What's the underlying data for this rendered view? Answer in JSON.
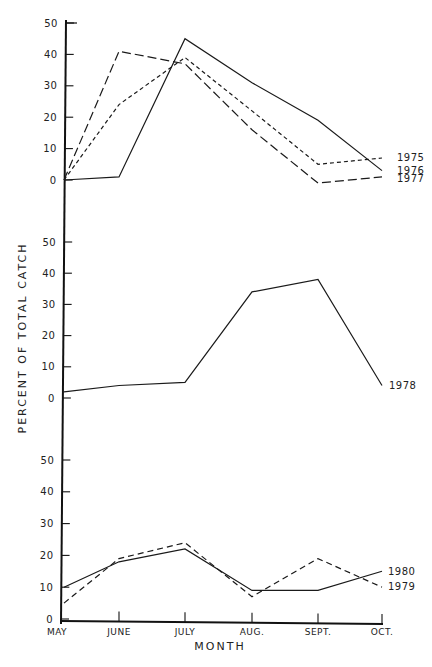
{
  "chart_data": {
    "type": "line",
    "title": "",
    "xlabel": "MONTH",
    "ylabel": "PERCENT OF TOTAL CATCH",
    "categories": [
      "MAY",
      "JUNE",
      "JULY",
      "AUG.",
      "SEPT.",
      "OCT."
    ],
    "panels": [
      {
        "name": "top",
        "ylim": [
          0,
          50
        ],
        "yticks": [
          0,
          10,
          20,
          30,
          40,
          50
        ],
        "series": [
          {
            "name": "1975",
            "style": "short-dash",
            "values": [
              0,
              24,
              39,
              22,
              5,
              7
            ]
          },
          {
            "name": "1976",
            "style": "solid",
            "values": [
              0,
              1,
              45,
              31,
              19,
              3
            ]
          },
          {
            "name": "1977",
            "style": "long-dash",
            "values": [
              0,
              41,
              37,
              16,
              -1,
              1
            ]
          }
        ]
      },
      {
        "name": "middle",
        "ylim": [
          0,
          50
        ],
        "yticks": [
          0,
          10,
          20,
          30,
          40,
          50
        ],
        "series": [
          {
            "name": "1978",
            "style": "solid",
            "values": [
              2,
              4,
              5,
              34,
              38,
              4
            ]
          }
        ]
      },
      {
        "name": "bottom",
        "ylim": [
          0,
          50
        ],
        "yticks": [
          0,
          10,
          20,
          30,
          40,
          50
        ],
        "series": [
          {
            "name": "1980",
            "style": "solid",
            "values": [
              10,
              18,
              22,
              9,
              9,
              15
            ]
          },
          {
            "name": "1979",
            "style": "dash",
            "values": [
              5,
              19,
              24,
              7,
              19,
              10
            ]
          }
        ]
      }
    ],
    "grid": false,
    "legend_position": "inline-right"
  },
  "labels": {
    "ylabel": "PERCENT OF TOTAL CATCH",
    "xlabel": "MONTH",
    "months": [
      "MAY",
      "JUNE",
      "JULY",
      "AUG.",
      "SEPT.",
      "OCT."
    ]
  }
}
